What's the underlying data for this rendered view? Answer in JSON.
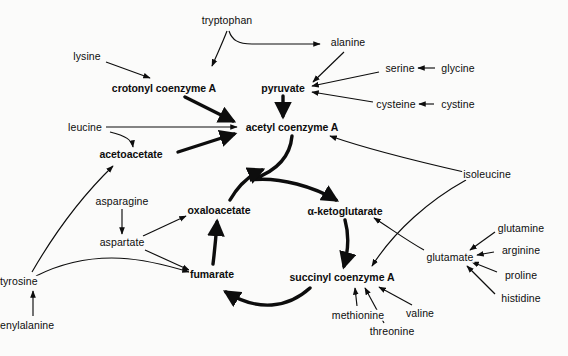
{
  "diagram": {
    "ink_color": "#0d0d0d",
    "background_color": "#fbfbfa",
    "nodes": [
      {
        "id": "tryptophan",
        "label": "tryptophan",
        "kind": "amino-acid",
        "x": 227,
        "y": 20
      },
      {
        "id": "lysine",
        "label": "lysine",
        "kind": "amino-acid",
        "x": 87,
        "y": 56
      },
      {
        "id": "alanine",
        "label": "alanine",
        "kind": "amino-acid",
        "x": 348,
        "y": 42
      },
      {
        "id": "glycine",
        "label": "glycine",
        "kind": "amino-acid",
        "x": 458,
        "y": 68
      },
      {
        "id": "serine",
        "label": "serine",
        "kind": "amino-acid",
        "x": 400,
        "y": 68
      },
      {
        "id": "cystine",
        "label": "cystine",
        "kind": "amino-acid",
        "x": 458,
        "y": 104
      },
      {
        "id": "cysteine",
        "label": "cysteine",
        "kind": "amino-acid",
        "x": 396,
        "y": 104
      },
      {
        "id": "crotonyl",
        "label": "crotonyl coenzyme A",
        "kind": "metabolite",
        "x": 164,
        "y": 88
      },
      {
        "id": "pyruvate",
        "label": "pyruvate",
        "kind": "metabolite",
        "x": 283,
        "y": 88
      },
      {
        "id": "leucine",
        "label": "leucine",
        "kind": "amino-acid",
        "x": 85,
        "y": 127
      },
      {
        "id": "acetylcoa",
        "label": "acetyl coenzyme A",
        "kind": "metabolite",
        "x": 292,
        "y": 127
      },
      {
        "id": "acetoacetate",
        "label": "acetoacetate",
        "kind": "metabolite",
        "x": 131,
        "y": 154
      },
      {
        "id": "isoleucine",
        "label": "isoleucine",
        "kind": "amino-acid",
        "x": 487,
        "y": 174
      },
      {
        "id": "asparagine",
        "label": "asparagine",
        "kind": "amino-acid",
        "x": 122,
        "y": 201
      },
      {
        "id": "oxaloacetate",
        "label": "oxaloacetate",
        "kind": "metabolite",
        "x": 219,
        "y": 210
      },
      {
        "id": "ketoglut",
        "label": "α-ketoglutarate",
        "kind": "metabolite",
        "x": 345,
        "y": 211
      },
      {
        "id": "glutamine",
        "label": "glutamine",
        "kind": "amino-acid",
        "x": 521,
        "y": 228
      },
      {
        "id": "aspartate",
        "label": "aspartate",
        "kind": "amino-acid",
        "x": 122,
        "y": 242
      },
      {
        "id": "arginine",
        "label": "arginine",
        "kind": "amino-acid",
        "x": 521,
        "y": 250
      },
      {
        "id": "glutamate",
        "label": "glutamate",
        "kind": "amino-acid",
        "x": 450,
        "y": 257
      },
      {
        "id": "proline",
        "label": "proline",
        "kind": "amino-acid",
        "x": 521,
        "y": 275
      },
      {
        "id": "fumarate",
        "label": "fumarate",
        "kind": "metabolite",
        "x": 212,
        "y": 274
      },
      {
        "id": "succinylcoa",
        "label": "succinyl coenzyme A",
        "kind": "metabolite",
        "x": 342,
        "y": 277
      },
      {
        "id": "histidine",
        "label": "histidine",
        "kind": "amino-acid",
        "x": 521,
        "y": 298
      },
      {
        "id": "tyrosine",
        "label": "tyrosine",
        "kind": "amino-acid",
        "x": 0,
        "y": 281,
        "clipped": true
      },
      {
        "id": "methionine",
        "label": "methionine",
        "kind": "amino-acid",
        "x": 358,
        "y": 315
      },
      {
        "id": "valine",
        "label": "valine",
        "kind": "amino-acid",
        "x": 420,
        "y": 313
      },
      {
        "id": "threonine",
        "label": "threonine",
        "kind": "amino-acid",
        "x": 392,
        "y": 331
      },
      {
        "id": "phenylalanine",
        "label": "enylalanine",
        "kind": "amino-acid",
        "x": 0,
        "y": 325,
        "clipped": true
      }
    ],
    "edges": [
      {
        "from": "tryptophan",
        "to": "crotonyl"
      },
      {
        "from": "tryptophan",
        "to": "alanine"
      },
      {
        "from": "lysine",
        "to": "crotonyl"
      },
      {
        "from": "alanine",
        "to": "pyruvate"
      },
      {
        "from": "glycine",
        "to": "serine"
      },
      {
        "from": "serine",
        "to": "pyruvate"
      },
      {
        "from": "cystine",
        "to": "cysteine"
      },
      {
        "from": "cysteine",
        "to": "pyruvate"
      },
      {
        "from": "crotonyl",
        "to": "acetylcoa"
      },
      {
        "from": "pyruvate",
        "to": "acetylcoa"
      },
      {
        "from": "leucine",
        "to": "acetylcoa"
      },
      {
        "from": "leucine",
        "to": "acetoacetate"
      },
      {
        "from": "acetoacetate",
        "to": "acetylcoa"
      },
      {
        "from": "tyrosine",
        "to": "acetoacetate"
      },
      {
        "from": "tyrosine",
        "to": "fumarate"
      },
      {
        "from": "phenylalanine",
        "to": "tyrosine"
      },
      {
        "from": "asparagine",
        "to": "aspartate"
      },
      {
        "from": "aspartate",
        "to": "oxaloacetate"
      },
      {
        "from": "aspartate",
        "to": "fumarate"
      },
      {
        "from": "isoleucine",
        "to": "acetylcoa"
      },
      {
        "from": "isoleucine",
        "to": "succinylcoa"
      },
      {
        "from": "glutamine",
        "to": "glutamate"
      },
      {
        "from": "arginine",
        "to": "glutamate"
      },
      {
        "from": "proline",
        "to": "glutamate"
      },
      {
        "from": "histidine",
        "to": "glutamate"
      },
      {
        "from": "glutamate",
        "to": "ketoglut"
      },
      {
        "from": "methionine",
        "to": "succinylcoa"
      },
      {
        "from": "threonine",
        "to": "succinylcoa"
      },
      {
        "from": "valine",
        "to": "succinylcoa"
      },
      {
        "from": "acetylcoa",
        "to": "ketoglut",
        "cycle": true
      },
      {
        "from": "ketoglut",
        "to": "succinylcoa",
        "cycle": true
      },
      {
        "from": "succinylcoa",
        "to": "fumarate",
        "cycle": true
      },
      {
        "from": "fumarate",
        "to": "oxaloacetate",
        "cycle": true
      },
      {
        "from": "oxaloacetate",
        "to": "acetylcoa",
        "cycle": true
      }
    ]
  }
}
